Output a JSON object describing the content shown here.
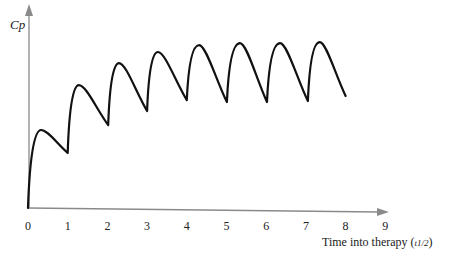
{
  "chart_data": {
    "type": "line",
    "title": "",
    "xlabel": "Time into therapy",
    "xlabel_unit": "t1/2",
    "ylabel": "Cp",
    "xlim": [
      0,
      9
    ],
    "ylim": [
      0,
      100
    ],
    "x_ticks": [
      0,
      1,
      2,
      3,
      4,
      5,
      6,
      7,
      8,
      9
    ],
    "y_ticks": [],
    "grid": false,
    "legend": null,
    "series": [
      {
        "name": "Cp",
        "color": "#111111",
        "description": "Plasma concentration during repeated dosing every half-life; accumulates toward steady state",
        "x": [
          0,
          0.33,
          1.0,
          1.28,
          2.02,
          2.29,
          3.0,
          3.27,
          4.0,
          4.31,
          5.01,
          5.34,
          6.02,
          6.35,
          7.05,
          7.35,
          8.0
        ],
        "values": [
          0,
          39.4,
          27.8,
          62.1,
          41.9,
          73.2,
          49.0,
          78.8,
          54.5,
          82.3,
          53.5,
          83.3,
          53.5,
          83.3,
          54.0,
          83.8,
          56.6
        ],
        "point_types": [
          "start",
          "peak",
          "trough",
          "peak",
          "trough",
          "peak",
          "trough",
          "peak",
          "trough",
          "peak",
          "trough",
          "peak",
          "trough",
          "peak",
          "trough",
          "peak",
          "end"
        ]
      }
    ],
    "annotations": []
  },
  "colors": {
    "axis": "#8a8a8a",
    "curve": "#111111",
    "text": "#222222"
  },
  "labels": {
    "y_axis": "Cp",
    "x_axis_text": "Time into therapy (",
    "x_axis_unit": "t1/2",
    "x_axis_close": ")",
    "ticks": [
      "0",
      "1",
      "2",
      "3",
      "4",
      "5",
      "6",
      "7",
      "8",
      "9"
    ]
  }
}
